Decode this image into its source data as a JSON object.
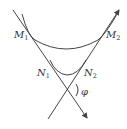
{
  "diagram": {
    "labels": {
      "M1": {
        "main": "M",
        "sub": "1"
      },
      "M2": {
        "main": "M",
        "sub": "2"
      },
      "N1": {
        "main": "N",
        "sub": "1"
      },
      "N2": {
        "main": "N",
        "sub": "2"
      },
      "angle": "φ"
    },
    "elements": [
      "line M1-N1 (arrow down-right)",
      "line N2-M2 (arrow up-right)",
      "arc M1-M2",
      "arc N1-N2",
      "angle φ at intersection"
    ],
    "colors": {
      "stroke": "#444444",
      "text": "#333333"
    }
  }
}
